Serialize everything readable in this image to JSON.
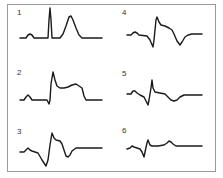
{
  "figure": {
    "panels": [
      {
        "label": "1",
        "label_pos": [
          17,
          12
        ],
        "stroke_width": 1.4,
        "points": "20,38 26,38 28,35 30,34 32,35 34,38 46,38 48,38 49,20 50,8 51,20 52,38 54,38 60,38 63,34 66,26 69,17 71,16 73,20 76,28 79,35 82,38 86,38 102,38"
      },
      {
        "label": "2",
        "label_pos": [
          17,
          72
        ],
        "stroke_width": 1.4,
        "points": "20,100 24,100 26,97 28,95 30,97 32,100 44,100 47,100 49,104 50,100 51,84 53,72 55,80 57,86 60,88 64,88 68,87 72,85 76,84 79,86 82,88 84,96 86,100 90,100 102,100"
      },
      {
        "label": "3",
        "label_pos": [
          17,
          131
        ],
        "stroke_width": 1.4,
        "points": "20,152 24,152 26,150 28,148 30,150 32,151 38,153 42,160 46,166 48,160 50,145 52,133 54,138 56,140 60,141 62,144 64,150 66,156 68,157 70,155 72,151 76,148 80,148 102,148"
      },
      {
        "label": "4",
        "label_pos": [
          122,
          12
        ],
        "stroke_width": 1.4,
        "points": "127,35 131,35 133,33 135,32 137,33 139,35 147,36 150,40 153,47 154,40 156,20 157,17 159,22 161,25 165,26 169,28 172,30 174,34 177,41 180,45 182,42 185,37 188,35 192,34 202,34"
      },
      {
        "label": "5",
        "label_pos": [
          122,
          73
        ],
        "stroke_width": 1.4,
        "points": "127,94 131,94 133,91 135,91 137,93 140,95 144,97 146,101 148,105 149,100 151,88 152,80 153,88 155,92 160,93 165,94 168,97 171,100 174,101 177,100 180,97 184,95 190,95 202,95"
      },
      {
        "label": "6",
        "label_pos": [
          122,
          130
        ],
        "stroke_width": 1.4,
        "points": "127,149 130,148 132,146 134,147 137,148 140,149 142,152 144,157 145,152 147,143 148,140 150,145 152,146 158,146 164,145 167,143 169,141 171,142 173,144 176,146 184,146 202,146"
      }
    ]
  },
  "colors": {
    "frame": "#9a9a9a",
    "trace": "#1a1a1a",
    "background": "#ffffff"
  }
}
